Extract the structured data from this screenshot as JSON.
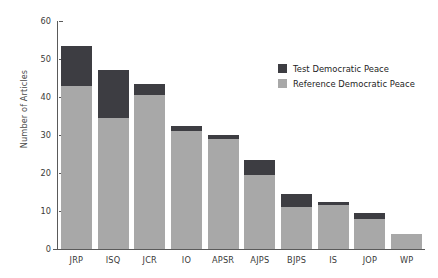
{
  "chart_data": {
    "type": "bar",
    "stacked": true,
    "title": "",
    "xlabel": "",
    "ylabel": "Number of Articles",
    "ylim": [
      0,
      60
    ],
    "yticks": [
      0,
      10,
      20,
      30,
      40,
      50,
      60
    ],
    "grid": false,
    "legend_position": "top-right",
    "categories": [
      "JRP",
      "ISQ",
      "JCR",
      "IO",
      "APSR",
      "AJPS",
      "BJPS",
      "IS",
      "JOP",
      "WP"
    ],
    "series": [
      {
        "name": "Reference Democratic Peace",
        "color": "#a8a8a8",
        "values": [
          43,
          34.5,
          40.5,
          31,
          29,
          19.5,
          11,
          11.5,
          8,
          4
        ]
      },
      {
        "name": "Test Democratic Peace",
        "color": "#3d3d42",
        "values": [
          10.5,
          12.5,
          3,
          1.5,
          1,
          4,
          3.5,
          1,
          1.5,
          0
        ]
      }
    ],
    "totals": [
      53.5,
      47,
      43.5,
      32.5,
      30,
      23.5,
      14.5,
      12.5,
      9.5,
      4
    ]
  },
  "legend": {
    "items": [
      {
        "label": "Test Democratic Peace",
        "color": "#3d3d42"
      },
      {
        "label": "Reference Democratic Peace",
        "color": "#a8a8a8"
      }
    ]
  },
  "axis": {
    "y_title": "Number of Articles"
  }
}
